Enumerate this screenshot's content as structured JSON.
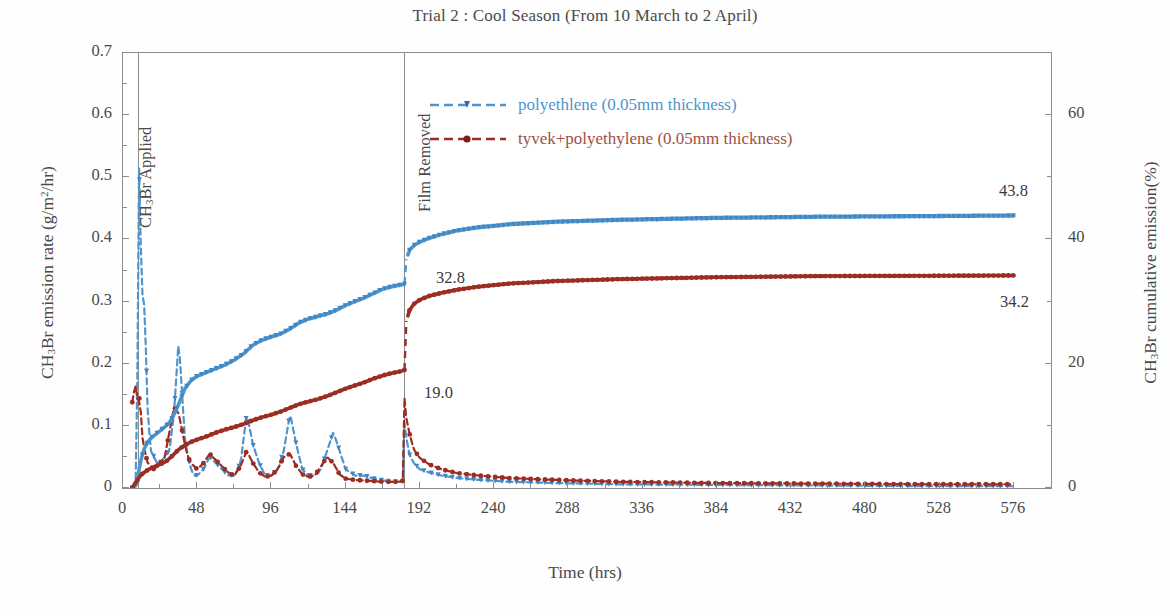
{
  "title": "Trial 2 : Cool Season (From 10 March to 2 April)",
  "axes": {
    "y_left_title_pre": "CH",
    "y_left_title_sub": "3",
    "y_left_title_mid": "Br emission rate (g/m",
    "y_left_title_sup": "2",
    "y_left_title_post": "/hr)",
    "y_right_title_pre": "CH",
    "y_right_title_sub": "3",
    "y_right_title_post": "Br cumulative emission(%)",
    "x_title": "Time (hrs)",
    "y_left_ticks": [
      "0",
      "0.1",
      "0.2",
      "0.3",
      "0.4",
      "0.5",
      "0.6",
      "0.7"
    ],
    "y_right_ticks": [
      "0",
      "20",
      "40",
      "60"
    ],
    "x_ticks": [
      "0",
      "48",
      "96",
      "144",
      "192",
      "240",
      "288",
      "336",
      "384",
      "432",
      "480",
      "528",
      "576"
    ]
  },
  "legend": {
    "items": [
      {
        "label": "polyethlene (0.05mm thickness)",
        "color": "#4f95cc"
      },
      {
        "label": "tyvek+polyethylene (0.05mm thickness)",
        "color": "#9b2d22"
      }
    ]
  },
  "annotations": {
    "applied": "CH3Br Applied",
    "applied_pre": "CH",
    "applied_sub": "3",
    "applied_post": "Br Applied",
    "film_removed": "Film Removed",
    "blue_cumulative_at_removal": "32.8",
    "red_rate_spike_at_removal": "19.0",
    "blue_cumulative_final": "43.8",
    "red_cumulative_final": "34.2"
  },
  "chart_data": {
    "type": "line",
    "title": "Trial 2 : Cool Season (From 10 March to 2 April)",
    "xlabel": "Time (hrs)",
    "ylabel": "CH3Br emission rate (g/m2/hr)",
    "ylabel_right": "CH3Br cumulative emission(%)",
    "xlim": [
      0,
      600
    ],
    "ylim": [
      0,
      0.7
    ],
    "ylim_right": [
      0,
      70
    ],
    "grid": false,
    "legend_position": "top-center",
    "x_tick_step": 48,
    "events": [
      {
        "label": "CH3Br Applied",
        "x": 10
      },
      {
        "label": "Film Removed",
        "x": 182
      }
    ],
    "series": [
      {
        "name": "polyethlene (0.05mm thickness) - emission rate",
        "axis": "left",
        "color": "#4f95cc",
        "style": "dashed-marker",
        "units": "g/m2/hr",
        "x": [
          6,
          9,
          10,
          11,
          12,
          14,
          16,
          18,
          20,
          22,
          24,
          27,
          30,
          33,
          36,
          38,
          40,
          42,
          44,
          46,
          48,
          52,
          56,
          60,
          64,
          68,
          72,
          76,
          80,
          84,
          88,
          92,
          96,
          100,
          104,
          108,
          112,
          116,
          120,
          124,
          128,
          132,
          136,
          140,
          144,
          150,
          156,
          162,
          168,
          174,
          178,
          181,
          182,
          183,
          185,
          188,
          192,
          198,
          206,
          216,
          230,
          250,
          280,
          320,
          380,
          450,
          520,
          576
        ],
        "y": [
          0.0,
          0.02,
          0.55,
          0.46,
          0.32,
          0.29,
          0.12,
          0.06,
          0.05,
          0.04,
          0.04,
          0.05,
          0.06,
          0.12,
          0.24,
          0.16,
          0.08,
          0.05,
          0.03,
          0.02,
          0.02,
          0.03,
          0.05,
          0.04,
          0.03,
          0.02,
          0.02,
          0.04,
          0.12,
          0.07,
          0.04,
          0.02,
          0.02,
          0.03,
          0.06,
          0.12,
          0.07,
          0.03,
          0.02,
          0.02,
          0.03,
          0.06,
          0.09,
          0.06,
          0.03,
          0.02,
          0.02,
          0.015,
          0.012,
          0.01,
          0.01,
          0.01,
          0.105,
          0.085,
          0.055,
          0.04,
          0.03,
          0.025,
          0.02,
          0.016,
          0.013,
          0.01,
          0.008,
          0.006,
          0.005,
          0.004,
          0.003,
          0.003
        ]
      },
      {
        "name": "tyvek+polyethylene (0.05mm thickness) - emission rate",
        "axis": "left",
        "color": "#9b2d22",
        "style": "dashed-marker",
        "units": "g/m2/hr",
        "x": [
          6,
          8,
          9,
          10,
          11,
          12,
          14,
          16,
          18,
          20,
          22,
          24,
          27,
          30,
          33,
          36,
          38,
          40,
          42,
          44,
          46,
          48,
          52,
          56,
          60,
          64,
          68,
          72,
          76,
          80,
          84,
          88,
          92,
          96,
          100,
          104,
          108,
          112,
          116,
          120,
          124,
          128,
          132,
          136,
          140,
          144,
          150,
          156,
          162,
          168,
          174,
          178,
          181,
          182,
          183,
          185,
          188,
          192,
          198,
          206,
          216,
          230,
          250,
          280,
          320,
          380,
          450,
          520,
          576
        ],
        "y": [
          0.138,
          0.168,
          0.15,
          0.128,
          0.155,
          0.09,
          0.06,
          0.04,
          0.035,
          0.03,
          0.035,
          0.04,
          0.05,
          0.09,
          0.13,
          0.12,
          0.095,
          0.07,
          0.05,
          0.04,
          0.035,
          0.03,
          0.04,
          0.055,
          0.045,
          0.035,
          0.025,
          0.02,
          0.035,
          0.06,
          0.04,
          0.025,
          0.018,
          0.02,
          0.03,
          0.05,
          0.055,
          0.035,
          0.022,
          0.018,
          0.02,
          0.035,
          0.05,
          0.04,
          0.022,
          0.015,
          0.013,
          0.012,
          0.011,
          0.01,
          0.01,
          0.01,
          0.012,
          0.145,
          0.115,
          0.09,
          0.062,
          0.048,
          0.038,
          0.03,
          0.024,
          0.02,
          0.016,
          0.013,
          0.01,
          0.008,
          0.007,
          0.006,
          0.006
        ]
      },
      {
        "name": "polyethlene (0.05mm thickness) - cumulative emission",
        "axis": "right",
        "color": "#4f95cc",
        "style": "marker-line",
        "units": "%",
        "x": [
          6,
          9,
          10,
          12,
          14,
          16,
          18,
          20,
          22,
          24,
          27,
          30,
          33,
          36,
          40,
          44,
          48,
          54,
          60,
          66,
          72,
          78,
          84,
          90,
          96,
          102,
          108,
          114,
          120,
          126,
          132,
          138,
          144,
          150,
          156,
          162,
          168,
          174,
          180,
          182,
          183,
          185,
          188,
          192,
          198,
          206,
          216,
          230,
          250,
          280,
          320,
          380,
          450,
          520,
          576
        ],
        "y": [
          0.0,
          0.5,
          2.5,
          5.0,
          6.5,
          7.4,
          8.0,
          8.4,
          8.8,
          9.2,
          9.8,
          10.5,
          11.8,
          13.5,
          16.0,
          17.3,
          18.0,
          18.6,
          19.2,
          19.8,
          20.6,
          21.6,
          23.0,
          23.8,
          24.3,
          24.8,
          25.6,
          26.6,
          27.2,
          27.6,
          28.0,
          28.6,
          29.4,
          30.0,
          30.6,
          31.3,
          32.0,
          32.4,
          32.7,
          32.8,
          36.5,
          38.2,
          39.0,
          39.6,
          40.2,
          40.8,
          41.4,
          41.9,
          42.4,
          42.8,
          43.1,
          43.4,
          43.6,
          43.7,
          43.8
        ]
      },
      {
        "name": "tyvek+polyethylene (0.05mm thickness) - cumulative emission",
        "axis": "right",
        "color": "#9b2d22",
        "style": "marker-line",
        "units": "%",
        "x": [
          6,
          9,
          12,
          16,
          20,
          24,
          28,
          32,
          36,
          40,
          44,
          48,
          54,
          60,
          66,
          72,
          78,
          84,
          90,
          96,
          102,
          108,
          114,
          120,
          126,
          132,
          138,
          144,
          150,
          156,
          162,
          168,
          174,
          180,
          182,
          183,
          185,
          188,
          192,
          198,
          206,
          216,
          230,
          250,
          280,
          320,
          380,
          450,
          520,
          576
        ],
        "y": [
          0.0,
          1.2,
          2.2,
          2.9,
          3.4,
          3.8,
          4.3,
          5.2,
          6.2,
          6.9,
          7.4,
          7.8,
          8.3,
          8.9,
          9.4,
          9.8,
          10.3,
          10.9,
          11.4,
          11.8,
          12.3,
          12.9,
          13.5,
          13.9,
          14.3,
          14.8,
          15.4,
          16.0,
          16.5,
          17.0,
          17.6,
          18.1,
          18.5,
          18.8,
          19.0,
          26.5,
          28.5,
          29.6,
          30.3,
          30.9,
          31.4,
          31.9,
          32.4,
          32.9,
          33.3,
          33.6,
          33.9,
          34.1,
          34.15,
          34.2
        ]
      }
    ]
  }
}
